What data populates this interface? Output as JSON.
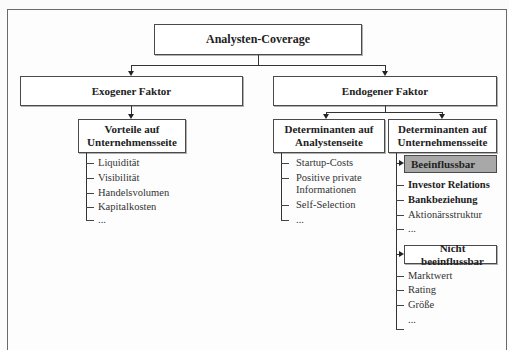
{
  "diagram": {
    "root": {
      "label": "Analysten-Coverage"
    },
    "level2": [
      {
        "label": "Exogener Faktor"
      },
      {
        "label": "Endogener Faktor"
      }
    ],
    "exogenous": {
      "box": {
        "line1": "Vorteile auf",
        "line2": "Unternehmensseite"
      },
      "items": [
        "Liquidität",
        "Visibilität",
        "Handelsvolumen",
        "Kapitalkosten",
        "..."
      ]
    },
    "endogenous_analyst": {
      "box": {
        "line1": "Determinanten auf",
        "line2": "Analystenseite"
      },
      "items": [
        "Startup-Costs",
        "Positive private",
        "Informationen",
        "Self-Selection",
        "..."
      ]
    },
    "endogenous_company": {
      "box": {
        "line1": "Determinanten auf",
        "line2": "Unternehmensseite"
      },
      "influenceable": {
        "label": "Beeinflussbar",
        "fill": "#a8a8a8",
        "items": [
          {
            "text": "Investor Relations",
            "bold": true
          },
          {
            "text": "Bankbeziehung",
            "bold": true
          },
          {
            "text": "Aktionärsstruktur",
            "bold": false
          },
          {
            "text": "...",
            "bold": false
          }
        ]
      },
      "non_influenceable": {
        "label": "Nicht beeinflussbar",
        "items": [
          "Marktwert",
          "Rating",
          "Größe",
          "..."
        ]
      }
    }
  }
}
